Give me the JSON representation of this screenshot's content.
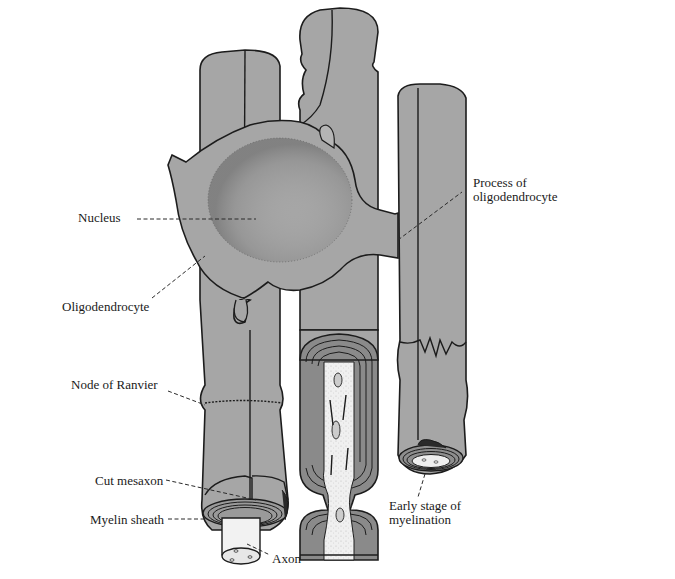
{
  "figure": {
    "labels": {
      "process": "Process of\noligodendrocyte",
      "process_line1": "Process of",
      "process_line2": "oligodendrocyte",
      "nucleus": "Nucleus",
      "oligodendrocyte": "Oligodendrocyte",
      "node_of_ranvier": "Node of Ranvier",
      "cut_mesaxon": "Cut mesaxon",
      "myelin_sheath": "Myelin sheath",
      "axon": "Axon",
      "early_stage_line1": "Early stage of",
      "early_stage_line2": "myelination"
    },
    "colors": {
      "cell_fill": "#a6a6a6",
      "outline": "#1c1c1c",
      "axon_fill": "#f2f2f2",
      "background": "#ffffff"
    }
  }
}
